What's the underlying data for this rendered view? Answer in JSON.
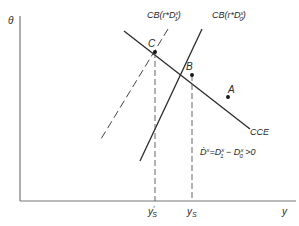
{
  "diagram": {
    "axes": {
      "y_axis_label": "θ",
      "x_axis_label": "y"
    },
    "curves": {
      "cce": {
        "label": "CCE"
      },
      "cb0": {
        "label_prefix": "CB(r*D",
        "label_sup": "x",
        "label_sub": "0",
        "label_suffix": ")",
        "style": "solid"
      },
      "cb1": {
        "label_prefix": "CB(r*D",
        "label_sup": "x",
        "label_sub": "1",
        "label_suffix": ")",
        "style": "dashed"
      }
    },
    "points": {
      "a": "A",
      "b": "B",
      "c": "C"
    },
    "x_ticks": {
      "ys_prime": {
        "base": "y",
        "sup": "′",
        "sub": "S"
      },
      "ys": {
        "base": "y",
        "sub": "S"
      }
    },
    "annotation": {
      "lhs": "Ḋ",
      "lhs_sup": "x",
      "eq": "=D",
      "d1_sup": "x",
      "d1_sub": "1",
      "minus": " − D",
      "d0_sup": "x",
      "d0_sub": "0",
      "rel": " >0"
    },
    "colors": {
      "ink": "#2a2a2a",
      "axis": "#777777"
    }
  }
}
